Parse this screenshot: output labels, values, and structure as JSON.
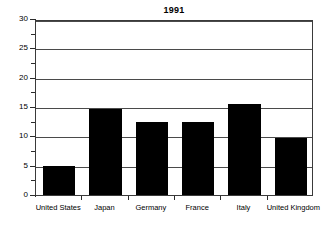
{
  "chart_data": {
    "type": "bar",
    "title": "1991",
    "xlabel": "",
    "ylabel": "",
    "categories": [
      "United States",
      "Japan",
      "Germany",
      "France",
      "Italy",
      "United Kingdom"
    ],
    "values": [
      5.0,
      14.6,
      12.5,
      12.5,
      15.5,
      9.7
    ],
    "ylim": [
      0,
      30
    ],
    "ytick_labels": [
      "0",
      "5",
      "10",
      "15",
      "20",
      "25",
      "30"
    ],
    "ytick_values": [
      0,
      5,
      10,
      15,
      20,
      25,
      30
    ],
    "yminor_tick_values": [
      2.5,
      7.5,
      12.5,
      17.5,
      22.5,
      27.5
    ],
    "grid": true,
    "grid_axis": "y",
    "legend": false,
    "bar_color": "#000000",
    "frame_color": "#3a3a3a",
    "grid_color": "#4a4a4a",
    "background": "#ffffff"
  }
}
